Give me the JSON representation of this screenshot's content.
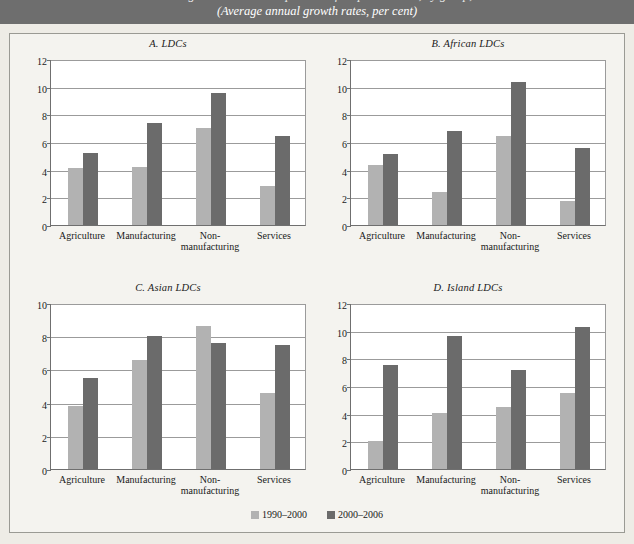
{
  "header": {
    "title_line_cut": "Changes in sectoral composition of output in LDCs, by group,",
    "subtitle": "(Average annual growth rates, per cent)"
  },
  "legend": {
    "position": "bottom-center",
    "entries": [
      {
        "label": "1990–2000",
        "color": "#b2b2b2",
        "key": "light"
      },
      {
        "label": "2000–2006",
        "color": "#6b6b6b",
        "key": "dark"
      }
    ]
  },
  "colors": {
    "series_1990_2000": "#b2b2b2",
    "series_2000_2006": "#6b6b6b",
    "header_band": "#6e6e6e",
    "page_background": "#eeece6",
    "panel_background": "#f4f3ef",
    "plot_background": "#ffffff",
    "axis": "#6f6f6f",
    "grid": "#9b9b9b"
  },
  "chart_data": [
    {
      "type": "bar",
      "panel": "A",
      "title": "A. LDCs",
      "categories": [
        "Agriculture",
        "Manufacturing",
        "Non-manufacturing",
        "Services"
      ],
      "category_lines": [
        [
          "Agriculture"
        ],
        [
          "Manufacturing"
        ],
        [
          "Non-",
          "manufacturing"
        ],
        [
          "Services"
        ]
      ],
      "series": [
        {
          "name": "1990–2000",
          "values": [
            4.1,
            4.2,
            7.0,
            2.85
          ]
        },
        {
          "name": "2000–2006",
          "values": [
            5.2,
            7.4,
            9.55,
            6.4
          ]
        }
      ],
      "ylim": [
        0,
        12
      ],
      "yticks": [
        0,
        2,
        4,
        6,
        8,
        10,
        12
      ],
      "xlabel": "",
      "ylabel": "",
      "grid": true
    },
    {
      "type": "bar",
      "panel": "B",
      "title": "B. African LDCs",
      "categories": [
        "Agriculture",
        "Manufacturing",
        "Non-manufacturing",
        "Services"
      ],
      "category_lines": [
        [
          "Agriculture"
        ],
        [
          "Manufacturing"
        ],
        [
          "Non-",
          "manufacturing"
        ],
        [
          "Services"
        ]
      ],
      "series": [
        {
          "name": "1990–2000",
          "values": [
            4.35,
            2.4,
            6.45,
            1.7
          ]
        },
        {
          "name": "2000–2006",
          "values": [
            5.1,
            6.8,
            10.35,
            5.6
          ]
        }
      ],
      "ylim": [
        0,
        12
      ],
      "yticks": [
        0,
        2,
        4,
        6,
        8,
        10,
        12
      ],
      "xlabel": "",
      "ylabel": "",
      "grid": true
    },
    {
      "type": "bar",
      "panel": "C",
      "title": "C. Asian LDCs",
      "categories": [
        "Agriculture",
        "Manufacturing",
        "Non-manufacturing",
        "Services"
      ],
      "category_lines": [
        [
          "Agriculture"
        ],
        [
          "Manufacturing"
        ],
        [
          "Non-",
          "manufacturing"
        ],
        [
          "Services"
        ]
      ],
      "series": [
        {
          "name": "1990–2000",
          "values": [
            3.8,
            6.55,
            8.6,
            4.6
          ]
        },
        {
          "name": "2000–2006",
          "values": [
            5.5,
            8.0,
            7.6,
            7.5
          ]
        }
      ],
      "ylim": [
        0,
        10
      ],
      "yticks": [
        0,
        2,
        4,
        6,
        8,
        10
      ],
      "xlabel": "",
      "ylabel": "",
      "grid": true
    },
    {
      "type": "bar",
      "panel": "D",
      "title": "D. Island LDCs",
      "categories": [
        "Agriculture",
        "Manufacturing",
        "Non-manufacturing",
        "Services"
      ],
      "category_lines": [
        [
          "Agriculture"
        ],
        [
          "Manufacturing"
        ],
        [
          "Non-",
          "manufacturing"
        ],
        [
          "Services"
        ]
      ],
      "series": [
        {
          "name": "1990–2000",
          "values": [
            2.05,
            4.05,
            4.5,
            5.5
          ]
        },
        {
          "name": "2000–2006",
          "values": [
            7.55,
            9.65,
            7.15,
            10.25
          ]
        }
      ],
      "ylim": [
        0,
        12
      ],
      "yticks": [
        0,
        2,
        4,
        6,
        8,
        10,
        12
      ],
      "xlabel": "",
      "ylabel": "",
      "grid": true
    }
  ]
}
